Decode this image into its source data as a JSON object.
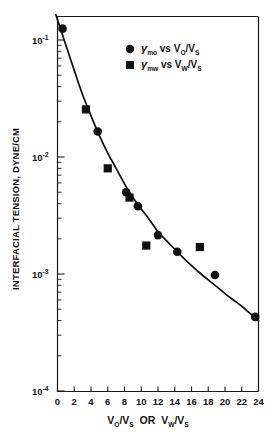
{
  "chart_data": {
    "type": "scatter",
    "title": "",
    "xlabel": "V_O/V_S  OR  V_W/V_S",
    "ylabel": "INTERFACIAL TENSION, DYNE/CM",
    "xlim": [
      0,
      24
    ],
    "ylim": [
      0.0001,
      0.2
    ],
    "yscale": "log",
    "xscale": "linear",
    "grid": false,
    "legend_position": "top-right",
    "xticks": [
      0,
      2,
      4,
      6,
      8,
      10,
      12,
      14,
      16,
      18,
      20,
      22,
      24
    ],
    "xtick_labels": [
      "0",
      "2",
      "4",
      "6",
      "8",
      "10",
      "12",
      "14",
      "16",
      "18",
      "20",
      "22",
      "24"
    ],
    "ytick_decades": [
      {
        "exp": "-1",
        "value": 0.1
      },
      {
        "exp": "-2",
        "value": 0.01
      },
      {
        "exp": "-3",
        "value": 0.001
      },
      {
        "exp": "-4",
        "value": 0.0001
      }
    ],
    "series": [
      {
        "name": "gamma_mo vs V_O/V_S",
        "marker": "circle",
        "points": [
          {
            "x": 0.6,
            "y": 0.125
          },
          {
            "x": 4.8,
            "y": 0.0165
          },
          {
            "x": 8.2,
            "y": 0.005
          },
          {
            "x": 9.6,
            "y": 0.0038
          },
          {
            "x": 12.0,
            "y": 0.00215
          },
          {
            "x": 14.3,
            "y": 0.00155
          },
          {
            "x": 18.8,
            "y": 0.00098
          },
          {
            "x": 23.6,
            "y": 0.00043
          }
        ]
      },
      {
        "name": "gamma_mw vs V_W/V_S",
        "marker": "square",
        "points": [
          {
            "x": 3.4,
            "y": 0.0255
          },
          {
            "x": 6.0,
            "y": 0.008
          },
          {
            "x": 8.6,
            "y": 0.0045
          },
          {
            "x": 10.6,
            "y": 0.00175
          },
          {
            "x": 17.0,
            "y": 0.0017
          }
        ]
      }
    ],
    "fit_curve": [
      {
        "x": -0.2,
        "y": 0.165
      },
      {
        "x": 1.0,
        "y": 0.09
      },
      {
        "x": 2.0,
        "y": 0.055
      },
      {
        "x": 3.0,
        "y": 0.034
      },
      {
        "x": 4.0,
        "y": 0.0225
      },
      {
        "x": 5.0,
        "y": 0.0152
      },
      {
        "x": 6.0,
        "y": 0.0108
      },
      {
        "x": 7.0,
        "y": 0.008
      },
      {
        "x": 8.0,
        "y": 0.0059
      },
      {
        "x": 9.0,
        "y": 0.0045
      },
      {
        "x": 10.0,
        "y": 0.0036
      },
      {
        "x": 11.0,
        "y": 0.0029
      },
      {
        "x": 12.0,
        "y": 0.0023
      },
      {
        "x": 13.0,
        "y": 0.00193
      },
      {
        "x": 14.0,
        "y": 0.00163
      },
      {
        "x": 15.0,
        "y": 0.00138
      },
      {
        "x": 16.0,
        "y": 0.00118
      },
      {
        "x": 17.0,
        "y": 0.00102
      },
      {
        "x": 18.0,
        "y": 0.00089
      },
      {
        "x": 19.0,
        "y": 0.00078
      },
      {
        "x": 20.0,
        "y": 0.00068
      },
      {
        "x": 21.0,
        "y": 0.0006
      },
      {
        "x": 22.0,
        "y": 0.00053
      },
      {
        "x": 23.0,
        "y": 0.00046
      },
      {
        "x": 24.0,
        "y": 0.0004
      }
    ],
    "legend": [
      {
        "marker": "circle",
        "symbol": "γ",
        "symbol_sub": "mo",
        "relation": "vs",
        "variable_num": "V",
        "variable_num_sub": "O",
        "variable_den": "V",
        "variable_den_sub": "S"
      },
      {
        "marker": "square",
        "symbol": "γ",
        "symbol_sub": "mw",
        "relation": "vs",
        "variable_num": "V",
        "variable_num_sub": "W",
        "variable_den": "V",
        "variable_den_sub": "S"
      }
    ]
  },
  "axes": {
    "y_title": "INTERFACIAL TENSION, DYNE/CM",
    "x_title_parts": {
      "v1": "V",
      "v1_sub": "O",
      "slash1": "/V",
      "s1_sub": "S",
      "or": "OR",
      "v2": "V",
      "v2_sub": "W",
      "slash2": "/V",
      "s2_sub": "S"
    },
    "mantissa": "10",
    "exp_1": "-1",
    "exp_2": "-2",
    "exp_3": "-3",
    "exp_4": "-4"
  },
  "colors": {
    "ink": "#111111",
    "background": "#ffffff"
  }
}
